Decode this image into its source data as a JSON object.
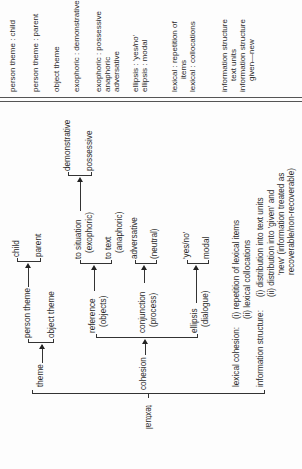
{
  "orientation": "rotated-90-ccw",
  "diagram": {
    "root_label": "textual",
    "theme": {
      "label": "theme",
      "options": [
        {
          "label": "person theme",
          "sub": [
            "child",
            "parent"
          ]
        },
        {
          "label": "object theme"
        }
      ]
    },
    "cohesion": {
      "label": "cohesion",
      "reference": {
        "label": "reference",
        "sublabel": "(objects)",
        "options": [
          {
            "label": "to situation",
            "sublabel": "(exophoric)",
            "sub": [
              "demonstrative",
              "possessive"
            ]
          },
          {
            "label": "to text",
            "sublabel": "(anaphoric)"
          }
        ]
      },
      "conjunction": {
        "label": "conjunction",
        "sublabel": "(process)",
        "options": [
          "adversative",
          "(neutral)"
        ]
      },
      "ellipsis": {
        "label": "ellipsis",
        "sublabel": "(dialogue)",
        "options": [
          "'yes/no'",
          "modal"
        ]
      }
    },
    "lexical_cohesion": {
      "label": "lexical cohesion:",
      "items": [
        "(i)  repetition of lexical items",
        "(ii) lexical collocations"
      ]
    },
    "information_structure": {
      "label": "information structure:",
      "items": [
        "(i)  distribution into text units",
        "(ii) distribution into 'given' and",
        "'new' (information treated as",
        "recoverable/non-recoverable)",
        "within each uni*"
      ]
    }
  },
  "right_column": [
    [
      "person theme : child"
    ],
    [
      "person theme : parent"
    ],
    [
      "object theme"
    ],
    [
      "exophoric : demonstrative"
    ],
    [
      "exophoric : possessive",
      "anaphoric",
      "adversative"
    ],
    [
      "ellipsis : 'yes/no'",
      "ellipsis : modal"
    ],
    [
      "lexical : repetition of",
      "items",
      "lexical : collocations"
    ],
    [
      "information structure",
      "text units",
      "information structure",
      "given—new"
    ]
  ]
}
